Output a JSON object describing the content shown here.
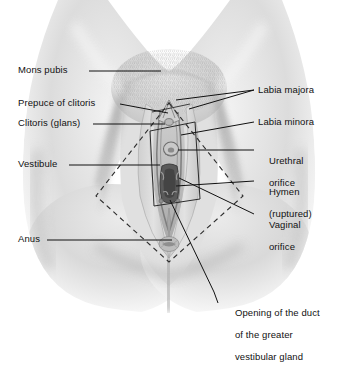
{
  "figure": {
    "type": "anatomical-illustration",
    "style": "grayscale halftone medical illustration with leader-line labels",
    "colors": {
      "background": "#ffffff",
      "skin_light": "#ededed",
      "skin_mid": "#d8d8d8",
      "skin_shadow": "#b5b5b5",
      "skin_deep": "#8e8e8e",
      "orifice_dark": "#4a4a4a",
      "leader_line": "#1a1a1a",
      "dashed_outline": "#2b2b2b",
      "text": "#111111"
    }
  },
  "labels_left": [
    {
      "id": "mons-pubis",
      "text": "Mons pubis",
      "x": 18,
      "y": 67
    },
    {
      "id": "prepuce-of-clitoris",
      "text": "Prepuce of clitoris",
      "x": 18,
      "y": 100
    },
    {
      "id": "clitoris-glans",
      "text": "Clitoris (glans)",
      "x": 18,
      "y": 120
    },
    {
      "id": "vestibule",
      "text": "Vestibule",
      "x": 18,
      "y": 161
    },
    {
      "id": "anus",
      "text": "Anus",
      "x": 18,
      "y": 236
    }
  ],
  "labels_right": [
    {
      "id": "labia-majora",
      "text": "Labia majora",
      "x": 258,
      "y": 86,
      "line2": ""
    },
    {
      "id": "labia-minora",
      "text": "Labia minora",
      "x": 258,
      "y": 118,
      "line2": ""
    },
    {
      "id": "urethral-orifice",
      "text": "Urethral",
      "x": 258,
      "y": 146,
      "line2": "orifice"
    },
    {
      "id": "hymen-ruptured",
      "text": "Hymen",
      "x": 258,
      "y": 177,
      "line2": "(ruptured)"
    },
    {
      "id": "vaginal-orifice",
      "text": "Vaginal",
      "x": 258,
      "y": 210,
      "line2": "orifice"
    }
  ],
  "labels_bottom": [
    {
      "id": "greater-vestibular-gland-duct",
      "line1": "Opening of the duct",
      "line2": "of the greater",
      "line3": "vestibular gland",
      "x": 222,
      "y": 299
    }
  ],
  "annotations": {
    "dashed_region": "perineum diamond outline",
    "inset_box": "magnified vestibule detail rectangle"
  }
}
